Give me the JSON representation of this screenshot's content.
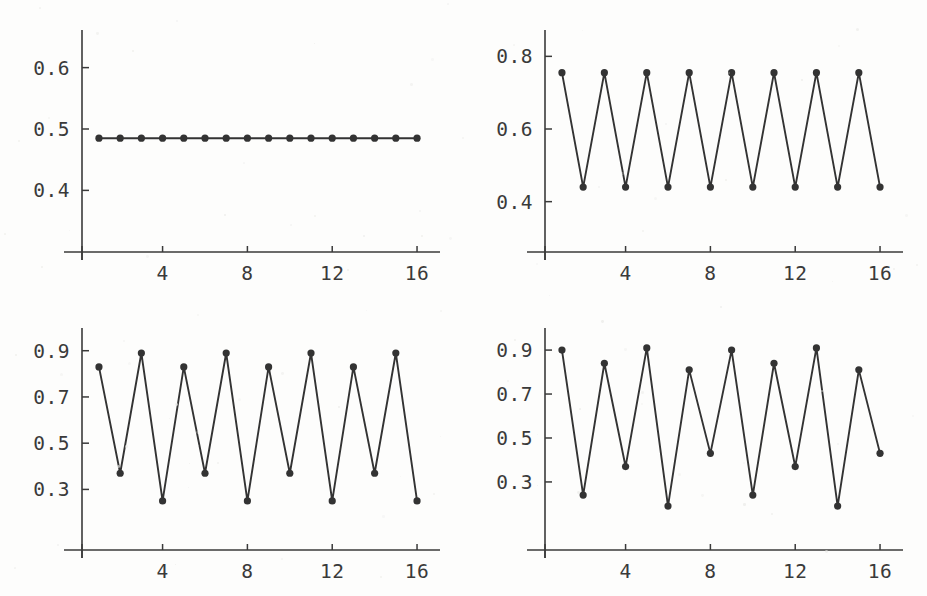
{
  "figure": {
    "background_color": "#fdfdfc",
    "ink_color": "#3a3a3a",
    "marker_color": "#333333",
    "layout": "2x2 grid of line plots",
    "panel_count": 4
  },
  "chart_data": [
    {
      "type": "line",
      "panel": "top-left",
      "title": "",
      "xlabel": "",
      "ylabel": "",
      "x": [
        1,
        2,
        3,
        4,
        5,
        6,
        7,
        8,
        9,
        10,
        11,
        12,
        13,
        14,
        15,
        16
      ],
      "values": [
        0.485,
        0.485,
        0.485,
        0.485,
        0.485,
        0.485,
        0.485,
        0.485,
        0.485,
        0.485,
        0.485,
        0.485,
        0.485,
        0.485,
        0.485,
        0.485
      ],
      "xlim": [
        0.2,
        16.8
      ],
      "ylim": [
        0.355,
        0.645
      ],
      "xticks": [
        4,
        8,
        12,
        16
      ],
      "xticklabels": [
        "4",
        "8",
        "12",
        "16"
      ],
      "yticks": [
        0.4,
        0.5,
        0.6
      ],
      "yticklabels": [
        "0.4",
        "0.5",
        "0.6"
      ],
      "grid": false,
      "legend": "none",
      "markers": true,
      "period": 1,
      "description": "Fixed point: constant orbit at 0.485"
    },
    {
      "type": "line",
      "panel": "top-right",
      "title": "",
      "xlabel": "",
      "ylabel": "",
      "x": [
        1,
        2,
        3,
        4,
        5,
        6,
        7,
        8,
        9,
        10,
        11,
        12,
        13,
        14,
        15,
        16
      ],
      "values": [
        0.755,
        0.44,
        0.755,
        0.44,
        0.755,
        0.44,
        0.755,
        0.44,
        0.755,
        0.44,
        0.755,
        0.44,
        0.755,
        0.44,
        0.755,
        0.44
      ],
      "xlim": [
        0.2,
        16.8
      ],
      "ylim": [
        0.355,
        0.845
      ],
      "xticks": [
        4,
        8,
        12,
        16
      ],
      "xticklabels": [
        "4",
        "8",
        "12",
        "16"
      ],
      "yticks": [
        0.4,
        0.6,
        0.8
      ],
      "yticklabels": [
        "0.4",
        "0.6",
        "0.8"
      ],
      "grid": false,
      "legend": "none",
      "markers": true,
      "period": 2,
      "description": "Period-2 cycle alternating 0.755 and 0.44"
    },
    {
      "type": "line",
      "panel": "bottom-left",
      "title": "",
      "xlabel": "",
      "ylabel": "",
      "x": [
        1,
        2,
        3,
        4,
        5,
        6,
        7,
        8,
        9,
        10,
        11,
        12,
        13,
        14,
        15,
        16
      ],
      "values": [
        0.83,
        0.37,
        0.89,
        0.25,
        0.83,
        0.37,
        0.89,
        0.25,
        0.83,
        0.37,
        0.89,
        0.25,
        0.83,
        0.37,
        0.89,
        0.25
      ],
      "xlim": [
        0.2,
        16.8
      ],
      "ylim": [
        0.185,
        0.955
      ],
      "xticks": [
        4,
        8,
        12,
        16
      ],
      "xticklabels": [
        "4",
        "8",
        "12",
        "16"
      ],
      "yticks": [
        0.3,
        0.5,
        0.7,
        0.9
      ],
      "yticklabels": [
        "0.3",
        "0.5",
        "0.7",
        "0.9"
      ],
      "grid": false,
      "legend": "none",
      "markers": true,
      "period": 4,
      "description": "Period-4 cycle: 0.83, 0.37, 0.89, 0.25"
    },
    {
      "type": "line",
      "panel": "bottom-right",
      "title": "",
      "xlabel": "",
      "ylabel": "",
      "x": [
        1,
        2,
        3,
        4,
        5,
        6,
        7,
        8,
        9,
        10,
        11,
        12,
        13,
        14,
        15,
        16
      ],
      "values": [
        0.9,
        0.24,
        0.84,
        0.37,
        0.91,
        0.19,
        0.81,
        0.43,
        0.9,
        0.24,
        0.84,
        0.37,
        0.91,
        0.19,
        0.81,
        0.43
      ],
      "xlim": [
        0.2,
        16.8
      ],
      "ylim": [
        0.145,
        0.955
      ],
      "xticks": [
        4,
        8,
        12,
        16
      ],
      "xticklabels": [
        "4",
        "8",
        "12",
        "16"
      ],
      "yticks": [
        0.3,
        0.5,
        0.7,
        0.9
      ],
      "yticklabels": [
        "0.3",
        "0.5",
        "0.7",
        "0.9"
      ],
      "grid": false,
      "legend": "none",
      "markers": true,
      "period": 8,
      "description": "Period-8 cycle: 0.90, 0.24, 0.84, 0.37, 0.91, 0.19, 0.81, 0.43"
    }
  ]
}
